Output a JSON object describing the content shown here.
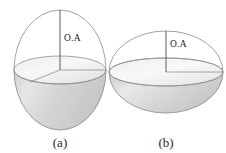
{
  "figure": {
    "background_color": "#ffffff",
    "outline_color": "#8a8a8a",
    "axis_color": "#4a4a4a",
    "shade_light": "#f4f4f4",
    "shade_mid": "#d9d9d9",
    "shade_dark": "#c2c2c2",
    "panels": [
      {
        "id": "a",
        "caption": "(a)",
        "axis_label": "O.A",
        "shape": "prolate-ellipsoid",
        "description": "Prolate ellipsoid with vertical optic axis",
        "center_x": 60,
        "center_y": 70,
        "semi_axis_horizontal": 46,
        "semi_axis_vertical": 60,
        "disc_semi_minor": 14,
        "label_x": 64,
        "label_y": 41,
        "caption_x": 60,
        "caption_y": 147
      },
      {
        "id": "b",
        "caption": "(b)",
        "axis_label": "O.A",
        "shape": "oblate-ellipsoid",
        "description": "Oblate ellipsoid with vertical optic axis",
        "center_x": 166,
        "center_y": 72,
        "semi_axis_horizontal": 57,
        "semi_axis_vertical": 41,
        "disc_semi_minor": 14,
        "label_x": 170,
        "label_y": 47,
        "caption_x": 166,
        "caption_y": 147
      }
    ]
  }
}
